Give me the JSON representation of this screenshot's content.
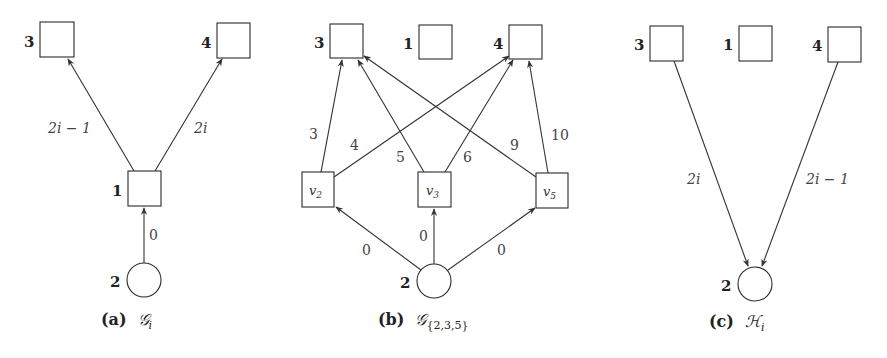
{
  "panels": [
    {
      "id": "a",
      "caption": {
        "tag": "(a)",
        "math": "𝒢",
        "sub": "i"
      },
      "nodes": [
        {
          "id": "3",
          "label": "3",
          "shape": "square"
        },
        {
          "id": "4",
          "label": "4",
          "shape": "square"
        },
        {
          "id": "1",
          "label": "1",
          "shape": "square"
        },
        {
          "id": "2",
          "label": "2",
          "shape": "circle"
        }
      ],
      "edges": [
        {
          "from": "1",
          "to": "3",
          "weight": "2i − 1"
        },
        {
          "from": "1",
          "to": "4",
          "weight": "2i"
        },
        {
          "from": "2",
          "to": "1",
          "weight": "0"
        }
      ]
    },
    {
      "id": "b",
      "caption": {
        "tag": "(b)",
        "math": "𝒢",
        "sub": "{2,3,5}"
      },
      "nodes": [
        {
          "id": "3",
          "label": "3",
          "shape": "square"
        },
        {
          "id": "1",
          "label": "1",
          "shape": "square"
        },
        {
          "id": "4",
          "label": "4",
          "shape": "square"
        },
        {
          "id": "v2",
          "label": "v",
          "sub": "2",
          "shape": "square"
        },
        {
          "id": "v3",
          "label": "v",
          "sub": "3",
          "shape": "square"
        },
        {
          "id": "v5",
          "label": "v",
          "sub": "5",
          "shape": "square"
        },
        {
          "id": "2",
          "label": "2",
          "shape": "circle"
        }
      ],
      "edges": [
        {
          "from": "v2",
          "to": "3",
          "weight": "3"
        },
        {
          "from": "v2",
          "to": "4",
          "weight": "4"
        },
        {
          "from": "v3",
          "to": "3",
          "weight": "5"
        },
        {
          "from": "v3",
          "to": "4",
          "weight": "6"
        },
        {
          "from": "v5",
          "to": "3",
          "weight": "9"
        },
        {
          "from": "v5",
          "to": "4",
          "weight": "10"
        },
        {
          "from": "2",
          "to": "v2",
          "weight": "0"
        },
        {
          "from": "2",
          "to": "v3",
          "weight": "0"
        },
        {
          "from": "2",
          "to": "v5",
          "weight": "0"
        }
      ]
    },
    {
      "id": "c",
      "caption": {
        "tag": "(c)",
        "math": "ℋ",
        "sub": "i"
      },
      "nodes": [
        {
          "id": "3",
          "label": "3",
          "shape": "square"
        },
        {
          "id": "1",
          "label": "1",
          "shape": "square"
        },
        {
          "id": "4",
          "label": "4",
          "shape": "square"
        },
        {
          "id": "2",
          "label": "2",
          "shape": "circle"
        }
      ],
      "edges": [
        {
          "from": "3",
          "to": "2",
          "weight": "2i"
        },
        {
          "from": "4",
          "to": "2",
          "weight": "2i − 1"
        }
      ]
    }
  ]
}
